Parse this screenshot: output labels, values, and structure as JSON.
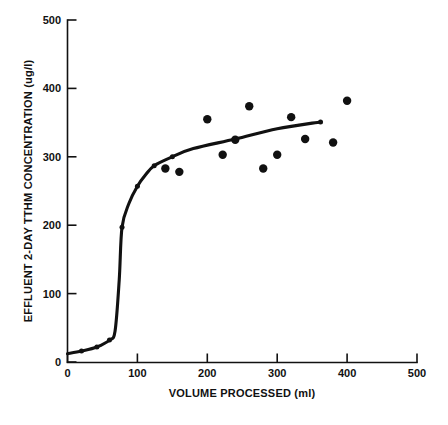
{
  "figure": {
    "background_color": "#ffffff",
    "ink_color": "#111111"
  },
  "chart_data": {
    "type": "scatter",
    "title": "",
    "subtitle": "",
    "xlabel": "VOLUME PROCESSED (ml)",
    "ylabel": "EFFLUENT 2-DAY TTHM CONCENTRATION (ug/l)",
    "xlim": [
      0,
      500
    ],
    "ylim": [
      0,
      500
    ],
    "xticks": [
      0,
      100,
      200,
      300,
      400,
      500
    ],
    "yticks": [
      0,
      100,
      200,
      300,
      400,
      500
    ],
    "xtick_labels": [
      "0",
      "100",
      "200",
      "300",
      "400",
      "500"
    ],
    "ytick_labels": [
      "0",
      "100",
      "200",
      "300",
      "400",
      "500"
    ],
    "grid": false,
    "legend": false,
    "legend_position": "none",
    "series": [
      {
        "name": "Measured effluent concentration",
        "type": "scatter",
        "marker": "filled-circle",
        "color": "#111111",
        "points": [
          {
            "x": 140,
            "y": 283
          },
          {
            "x": 160,
            "y": 278
          },
          {
            "x": 200,
            "y": 355
          },
          {
            "x": 222,
            "y": 303
          },
          {
            "x": 240,
            "y": 325
          },
          {
            "x": 260,
            "y": 374
          },
          {
            "x": 280,
            "y": 283
          },
          {
            "x": 300,
            "y": 303
          },
          {
            "x": 320,
            "y": 358
          },
          {
            "x": 340,
            "y": 326
          },
          {
            "x": 380,
            "y": 321
          },
          {
            "x": 400,
            "y": 382
          }
        ]
      },
      {
        "name": "Fitted breakthrough curve",
        "type": "line",
        "marker": "filled-circle",
        "color": "#111111",
        "points": [
          {
            "x": 0,
            "y": 12
          },
          {
            "x": 20,
            "y": 16
          },
          {
            "x": 42,
            "y": 22
          },
          {
            "x": 60,
            "y": 32
          },
          {
            "x": 68,
            "y": 45
          },
          {
            "x": 74,
            "y": 120
          },
          {
            "x": 78,
            "y": 197
          },
          {
            "x": 88,
            "y": 232
          },
          {
            "x": 100,
            "y": 257
          },
          {
            "x": 112,
            "y": 274
          },
          {
            "x": 124,
            "y": 287
          },
          {
            "x": 150,
            "y": 300
          },
          {
            "x": 180,
            "y": 312
          },
          {
            "x": 240,
            "y": 326
          },
          {
            "x": 300,
            "y": 341
          },
          {
            "x": 362,
            "y": 351
          }
        ]
      }
    ]
  }
}
